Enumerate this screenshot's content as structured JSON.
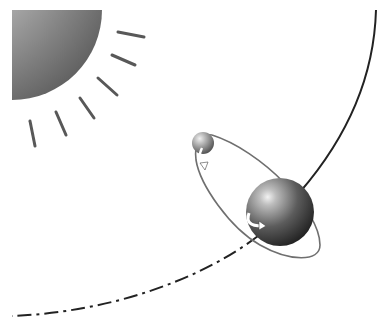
{
  "diagram": {
    "title": "Sun, Earth and Moon orbital illustration",
    "bodies": [
      {
        "name": "Sun",
        "icon": "sun-icon",
        "shape": "quarter-disk with rays",
        "rays": 7
      },
      {
        "name": "Earth",
        "icon": "earth-sphere-icon",
        "rotation_arrow": true
      },
      {
        "name": "Moon",
        "icon": "moon-sphere-icon",
        "rotation_arrow": true
      }
    ],
    "orbits": [
      {
        "name": "Earth orbit around Sun",
        "style": "solid then dashed arc"
      },
      {
        "name": "Moon orbit around Earth",
        "style": "tilted ellipse"
      }
    ],
    "colors": {
      "background": "#ffffff",
      "line": "#222222",
      "sun_light": "#e8e8e8",
      "sun_dark": "#6a6a6a",
      "ray": "#555555",
      "earth_light": "#cfcfcf",
      "earth_dark": "#2a2a2a",
      "moon_orbit": "#777777"
    }
  }
}
